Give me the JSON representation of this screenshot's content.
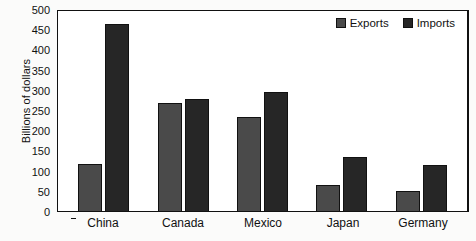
{
  "chart_data": {
    "type": "bar",
    "title": "",
    "xlabel": "",
    "ylabel": "Billions of dollars",
    "ylim": [
      0,
      500
    ],
    "ytick_step": 50,
    "yticks": [
      500,
      450,
      400,
      350,
      300,
      250,
      200,
      150,
      100,
      50,
      0
    ],
    "grid": false,
    "legend_position": "top-right",
    "categories": [
      "China",
      "Canada",
      "Mexico",
      "Japan",
      "Germany"
    ],
    "series": [
      {
        "name": "Exports",
        "color": "#4a4a4a",
        "values": [
          116,
          267,
          232,
          65,
          50
        ]
      },
      {
        "name": "Imports",
        "color": "#262626",
        "values": [
          463,
          278,
          295,
          133,
          114
        ]
      }
    ]
  },
  "legend": {
    "items": [
      {
        "label": "Exports"
      },
      {
        "label": "Imports"
      }
    ]
  },
  "colors": {
    "exports": "#4a4a4a",
    "imports": "#262626",
    "axis": "#111111",
    "plot_background": "#ffffff",
    "page_background": "#fbfbfa"
  }
}
